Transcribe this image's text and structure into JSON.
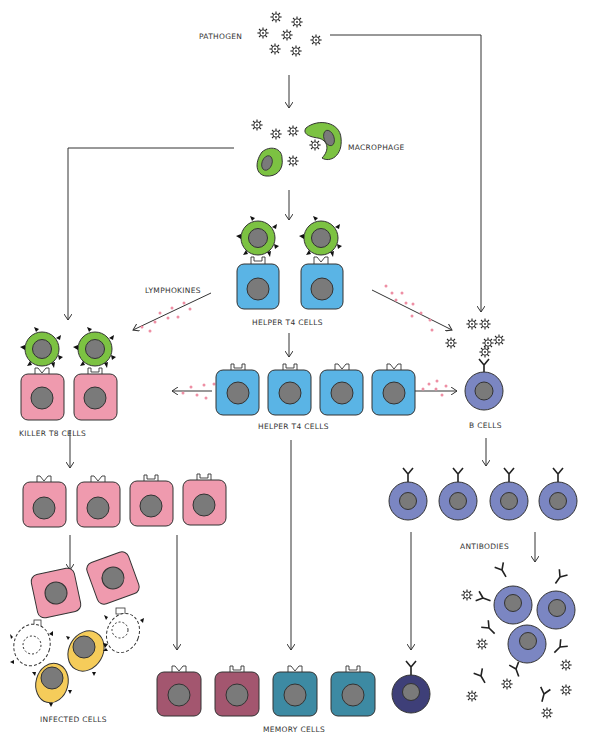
{
  "labels": {
    "pathogen": "PATHOGEN",
    "macrophage": "MACROPHAGE",
    "lymphokines": "LYMPHOKINES",
    "helper_top": "HELPER T4 CELLS",
    "helper_mid": "HELPER T4 CELLS",
    "killer": "KILLER T8 CELLS",
    "b_cells": "B CELLS",
    "antibodies": "ANTIBODIES",
    "infected": "INFECTED CELLS",
    "memory": "MEMORY CELLS"
  },
  "colors": {
    "macrophage_green": "#7cc242",
    "helper_blue": "#5ab4e5",
    "killer_pink": "#ef9aae",
    "b_cell_purple": "#7b86c2",
    "infected_yellow": "#f5cc5a",
    "memory_killer": "#a3566f",
    "memory_helper": "#3d8aa3",
    "memory_b": "#3e3f78",
    "nucleus_gray": "#7a7a7a",
    "lymphokine_dot": "#ee8fa4",
    "line": "#333333"
  },
  "cells": {
    "helper_top_count": 2,
    "killer_top_count": 2,
    "helper_mid_count": 4,
    "killer_mid_count": 4,
    "b_mid_count": 4,
    "memory_count": 5
  }
}
